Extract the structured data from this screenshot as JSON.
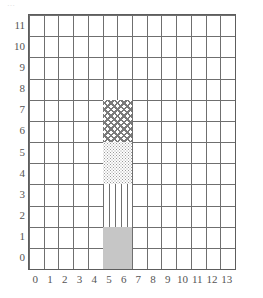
{
  "top_artifact": {
    "text": "…"
  },
  "chart_data": {
    "type": "bar",
    "title": "",
    "subtitle": "",
    "xlabel": "",
    "ylabel": "",
    "orientation": "vertical",
    "grid": true,
    "legend_position": "none",
    "xlim": [
      -0.5,
      13.5
    ],
    "ylim": [
      -0.5,
      11.5
    ],
    "xticks": [
      0,
      1,
      2,
      3,
      4,
      5,
      6,
      7,
      8,
      9,
      10,
      11,
      12,
      13
    ],
    "xtick_labels": [
      "0",
      "1",
      "2",
      "3",
      "4",
      "5",
      "6",
      "7",
      "8",
      "9",
      "10",
      "11",
      "12",
      "13"
    ],
    "yticks": [
      0,
      1,
      2,
      3,
      4,
      5,
      6,
      7,
      8,
      9,
      10,
      11
    ],
    "ytick_labels": [
      "0",
      "1",
      "2",
      "3",
      "4",
      "5",
      "6",
      "7",
      "8",
      "9",
      "10",
      "11"
    ],
    "bar": {
      "x_start": 4.5,
      "x_end": 6.5,
      "x_center": 5.5,
      "width": 2.0,
      "total_height": 8.0,
      "y_bottom": -0.5,
      "y_top": 7.5
    },
    "segments": [
      {
        "name": "segment-solid-gray",
        "pattern": "solid",
        "color": "#c6c6c6",
        "y_from": -0.5,
        "y_to": 1.5,
        "height": 2.0
      },
      {
        "name": "segment-vertical-stripes",
        "pattern": "vertical-lines",
        "color": "#6f6f6f",
        "y_from": 1.5,
        "y_to": 3.5,
        "height": 2.0
      },
      {
        "name": "segment-dotted",
        "pattern": "dotted",
        "color": "#9a9a9a",
        "y_from": 3.5,
        "y_to": 5.5,
        "height": 2.0
      },
      {
        "name": "segment-crosshatch",
        "pattern": "cross-hatch",
        "color": "#7a7a7a",
        "y_from": 5.5,
        "y_to": 7.5,
        "height": 2.0
      }
    ],
    "categories": [
      "5.5"
    ],
    "values": [
      8.0
    ],
    "series": [
      {
        "name": "solid-gray",
        "values": [
          2.0
        ]
      },
      {
        "name": "vertical-stripes",
        "values": [
          2.0
        ]
      },
      {
        "name": "dotted",
        "values": [
          2.0
        ]
      },
      {
        "name": "cross-hatch",
        "values": [
          2.0
        ]
      }
    ],
    "colors": {
      "grid": "#6f6f6f",
      "frame": "#5d5d5d",
      "tick_text": "#555555",
      "background": "#ffffff"
    }
  }
}
